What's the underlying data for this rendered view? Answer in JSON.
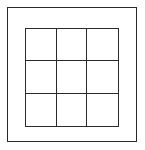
{
  "diagram": {
    "type": "grid",
    "rows": 3,
    "columns": 3,
    "cells": [
      [
        "",
        "",
        ""
      ],
      [
        "",
        "",
        ""
      ],
      [
        "",
        "",
        ""
      ]
    ],
    "line_color": "#2a2a2a",
    "background": "#ffffff"
  }
}
